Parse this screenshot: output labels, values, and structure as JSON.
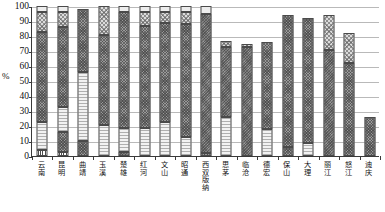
{
  "chart_data": {
    "type": "bar",
    "stacked": true,
    "title": "",
    "xlabel": "",
    "ylabel": "%",
    "ylim": [
      0,
      100
    ],
    "yticks": [
      0,
      10,
      20,
      30,
      40,
      50,
      60,
      70,
      80,
      90,
      100
    ],
    "grid": true,
    "legend": "none",
    "categories": [
      "云南",
      "昆明",
      "曲靖",
      "玉溪",
      "楚雄",
      "红河",
      "文山",
      "昭通",
      "西双版纳",
      "思茅",
      "临沧",
      "德宏",
      "保山",
      "大理",
      "丽江",
      "怒江",
      "迪庆"
    ],
    "series": [
      {
        "name": "segment-1",
        "pattern": "p-vert",
        "values": [
          4,
          3,
          0,
          0,
          0,
          0,
          0,
          0,
          0,
          0,
          0,
          0,
          0,
          0,
          0,
          0,
          0
        ]
      },
      {
        "name": "segment-2",
        "pattern": "p-dark",
        "values": [
          0,
          13,
          10,
          0,
          3,
          0,
          0,
          0,
          2,
          0,
          0,
          0,
          6,
          0,
          0,
          0,
          0
        ]
      },
      {
        "name": "segment-3",
        "pattern": "p-light",
        "values": [
          19,
          17,
          46,
          21,
          16,
          19,
          23,
          13,
          0,
          26,
          0,
          18,
          0,
          9,
          0,
          0,
          0
        ]
      },
      {
        "name": "segment-4",
        "pattern": "p-dark",
        "values": [
          60,
          53,
          42,
          60,
          77,
          68,
          66,
          75,
          93,
          47,
          73,
          58,
          88,
          83,
          71,
          62,
          26
        ]
      },
      {
        "name": "segment-5",
        "pattern": "p-dot",
        "values": [
          13,
          10,
          0,
          19,
          0,
          9,
          7,
          8,
          0,
          4,
          2,
          0,
          0,
          0,
          23,
          20,
          0
        ]
      },
      {
        "name": "segment-6",
        "pattern": "p-solidlt",
        "values": [
          4,
          4,
          0,
          0,
          4,
          4,
          4,
          4,
          5,
          0,
          0,
          0,
          0,
          0,
          0,
          0,
          0
        ]
      }
    ]
  },
  "axis": {
    "y_unit": "%",
    "tick_labels": [
      "100",
      "90",
      "80",
      "70",
      "60",
      "50",
      "40",
      "30",
      "20",
      "10",
      "0"
    ]
  }
}
